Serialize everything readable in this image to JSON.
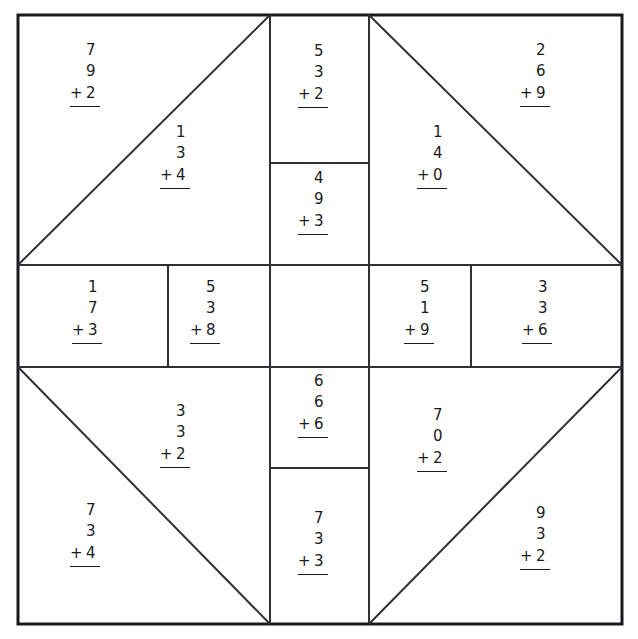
{
  "worksheet": {
    "title": "Addition Quilt Worksheet",
    "background_color": "#ffffff",
    "line_color": "#1a1a20",
    "text_color": "#1a1a20",
    "frame": {
      "x": 17,
      "y": 14,
      "width": 605,
      "height": 610
    }
  },
  "problems": [
    {
      "id": "top-left-corner",
      "a": "7",
      "b": "9",
      "op": "+",
      "c": "2"
    },
    {
      "id": "top-left-inner",
      "a": "1",
      "b": "3",
      "op": "+",
      "c": "4"
    },
    {
      "id": "top-center-upper",
      "a": "5",
      "b": "3",
      "op": "+",
      "c": "2"
    },
    {
      "id": "top-center-lower",
      "a": "4",
      "b": "9",
      "op": "+",
      "c": "3"
    },
    {
      "id": "top-right-inner",
      "a": "1",
      "b": "4",
      "op": "+",
      "c": "0"
    },
    {
      "id": "top-right-corner",
      "a": "2",
      "b": "6",
      "op": "+",
      "c": "9"
    },
    {
      "id": "middle-left-outer",
      "a": "1",
      "b": "7",
      "op": "+",
      "c": "3"
    },
    {
      "id": "middle-left-inner",
      "a": "5",
      "b": "3",
      "op": "+",
      "c": "8"
    },
    {
      "id": "middle-right-inner",
      "a": "5",
      "b": "1",
      "op": "+",
      "c": "9"
    },
    {
      "id": "middle-right-outer",
      "a": "3",
      "b": "3",
      "op": "+",
      "c": "6"
    },
    {
      "id": "bottom-left-inner",
      "a": "3",
      "b": "3",
      "op": "+",
      "c": "2"
    },
    {
      "id": "bottom-center-upper",
      "a": "6",
      "b": "6",
      "op": "+",
      "c": "6"
    },
    {
      "id": "bottom-center-lower",
      "a": "7",
      "b": "3",
      "op": "+",
      "c": "3"
    },
    {
      "id": "bottom-right-inner",
      "a": "7",
      "b": "0",
      "op": "+",
      "c": "2"
    },
    {
      "id": "bottom-left-corner",
      "a": "7",
      "b": "3",
      "op": "+",
      "c": "4"
    },
    {
      "id": "bottom-right-corner",
      "a": "9",
      "b": "3",
      "op": "+",
      "c": "2"
    }
  ],
  "empty_cells": [
    {
      "id": "center-cell"
    }
  ]
}
